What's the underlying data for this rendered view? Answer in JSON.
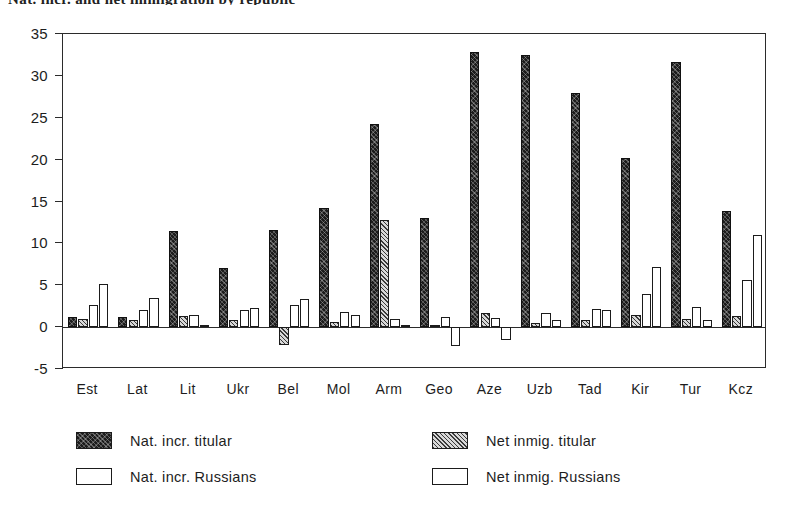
{
  "figure": {
    "title_sliver": "Nat. incr. and net immigration by republic",
    "background": "#ffffff",
    "frame_color": "#2b2b2b"
  },
  "chart_data": {
    "type": "bar",
    "title": "",
    "xlabel": "",
    "ylabel": "",
    "ylim": [
      -5,
      35
    ],
    "yticks": [
      -5,
      0,
      5,
      10,
      15,
      20,
      25,
      30,
      35
    ],
    "grid": false,
    "legend_position": "below-plot",
    "categories": [
      "Est",
      "Lat",
      "Lit",
      "Ukr",
      "Bel",
      "Mol",
      "Arm",
      "Geo",
      "Aze",
      "Uzb",
      "Tad",
      "Kir",
      "Tur",
      "Kcz"
    ],
    "series": [
      {
        "name": "Nat. incr. titular",
        "pattern": "dense-speckle-black",
        "color": "#1c1c1c",
        "values": [
          1.2,
          1.2,
          11.5,
          7.1,
          11.6,
          14.2,
          24.3,
          13.0,
          32.9,
          32.5,
          28.0,
          20.2,
          31.7,
          13.9
        ]
      },
      {
        "name": "Net inmig. titular",
        "pattern": "diagonal-hatch-grey",
        "color": "#d8d8d8",
        "values": [
          1.0,
          0.9,
          1.3,
          0.8,
          -2.1,
          0.6,
          12.8,
          0.3,
          1.7,
          0.5,
          0.9,
          1.5,
          1.0,
          1.3
        ]
      },
      {
        "name": "Nat. incr. Russians",
        "pattern": "open-white",
        "color": "#ffffff",
        "values": [
          2.6,
          2.0,
          1.5,
          2.1,
          2.6,
          1.8,
          1.0,
          1.2,
          1.1,
          1.7,
          2.2,
          3.9,
          2.4,
          5.6
        ]
      },
      {
        "name": "Net inmig. Russians",
        "pattern": "open-white",
        "color": "#ffffff",
        "values": [
          5.2,
          3.5,
          0.2,
          2.3,
          3.3,
          1.4,
          0.2,
          -2.2,
          -1.5,
          0.9,
          2.0,
          7.2,
          0.9,
          11.0
        ]
      }
    ]
  },
  "legend": {
    "entries": [
      {
        "label": "Nat. incr. titular",
        "series_index": 0
      },
      {
        "label": "Nat. incr. Russians",
        "series_index": 2
      },
      {
        "label": "Net inmig. titular",
        "series_index": 1
      },
      {
        "label": "Net inmig. Russians",
        "series_index": 3
      }
    ]
  },
  "axis": {
    "y_tick_labels": [
      "35",
      "30",
      "25",
      "20",
      "15",
      "10",
      "5",
      "0",
      "-5"
    ],
    "x_tick_labels": [
      "Est",
      "Lat",
      "Lit",
      "Ukr",
      "Bel",
      "Mol",
      "Arm",
      "Geo",
      "Aze",
      "Uzb",
      "Tad",
      "Kir",
      "Tur",
      "Kcz"
    ]
  }
}
